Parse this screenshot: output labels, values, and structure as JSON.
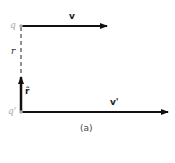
{
  "diagram": {
    "charges": [
      {
        "label": "q",
        "x": 21,
        "y": 26
      },
      {
        "label": "q'",
        "x": 21,
        "y": 112
      }
    ],
    "vectors": [
      {
        "label": "v",
        "from": [
          22,
          26
        ],
        "to": [
          107,
          26
        ]
      },
      {
        "label": "v'",
        "from": [
          22,
          112
        ],
        "to": [
          168,
          112
        ]
      },
      {
        "label": "r̂",
        "from": [
          21,
          112
        ],
        "to": [
          21,
          76
        ]
      }
    ],
    "distance_label": "r",
    "caption": "(a)",
    "colors": {
      "line": "#111111",
      "charge": "#aaaaaa"
    }
  }
}
